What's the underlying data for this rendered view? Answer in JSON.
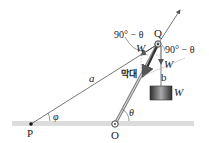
{
  "diagram": {
    "points": {
      "P": "P",
      "O": "O",
      "Q": "Q"
    },
    "lengths": {
      "a": "a",
      "b": "b"
    },
    "angles": {
      "phi": "φ",
      "theta_at_O": "θ",
      "angle_left_of_Q": "90° − θ",
      "angle_right_of_Q": "90° − θ"
    },
    "forces": {
      "W_along_string": "W",
      "W_down": "W",
      "W_block": "W"
    },
    "rod_label": "막대",
    "colors": {
      "line": "#555555",
      "rod": "#777777",
      "ground": "#d8d8d8",
      "block_dark": "#333333",
      "block_light": "#999999"
    }
  }
}
